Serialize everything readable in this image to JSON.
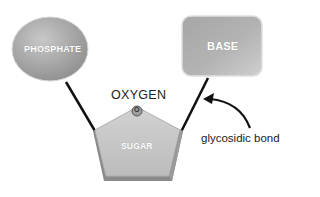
{
  "diagram": {
    "nodes": {
      "phosphate": {
        "label": "PHOSPHATE",
        "shape": "ellipse",
        "color": "#a9a9a9"
      },
      "base": {
        "label": "BASE",
        "shape": "rounded-rectangle",
        "color": "#b3b3b3"
      },
      "sugar": {
        "label": "SUGAR",
        "shape": "pentagon",
        "color": "#c4c4c4"
      },
      "oxygen_atom": {
        "label": "O",
        "shape": "small-circle"
      }
    },
    "labels": {
      "oxygen": "OXYGEN",
      "glycosidic_bond": "glycosidic bond"
    },
    "edges": [
      {
        "from": "phosphate",
        "to": "sugar"
      },
      {
        "from": "base",
        "to": "sugar",
        "annotation": "glycosidic bond"
      }
    ]
  }
}
